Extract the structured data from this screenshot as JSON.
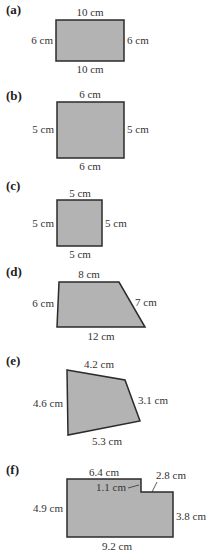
{
  "figure": {
    "shape_fill": "#b3b3b3",
    "stroke": "#2b2b2b",
    "parts": [
      {
        "id": "a",
        "label": "(a)",
        "shape": "rectangle",
        "sides": {
          "top": "10 cm",
          "bottom": "10 cm",
          "left": "6 cm",
          "right": "6 cm"
        }
      },
      {
        "id": "b",
        "label": "(b)",
        "shape": "rectangle",
        "sides": {
          "top": "6 cm",
          "bottom": "6 cm",
          "left": "5 cm",
          "right": "5 cm"
        }
      },
      {
        "id": "c",
        "label": "(c)",
        "shape": "square",
        "sides": {
          "top": "5 cm",
          "bottom": "5 cm",
          "left": "5 cm",
          "right": "5 cm"
        }
      },
      {
        "id": "d",
        "label": "(d)",
        "shape": "trapezium",
        "sides": {
          "top": "8 cm",
          "left": "6 cm",
          "slant": "7 cm",
          "bottom": "12 cm"
        }
      },
      {
        "id": "e",
        "label": "(e)",
        "shape": "quadrilateral",
        "sides": {
          "top": "4.2 cm",
          "right": "3.1 cm",
          "left": "4.6 cm",
          "bottom": "5.3 cm"
        }
      },
      {
        "id": "f",
        "label": "(f)",
        "shape": "compound",
        "sides": {
          "top": "6.4 cm",
          "step_height": "1.1 cm",
          "step_width": "2.8 cm",
          "left": "4.9 cm",
          "right": "3.8 cm",
          "bottom": "9.2 cm"
        }
      }
    ]
  }
}
